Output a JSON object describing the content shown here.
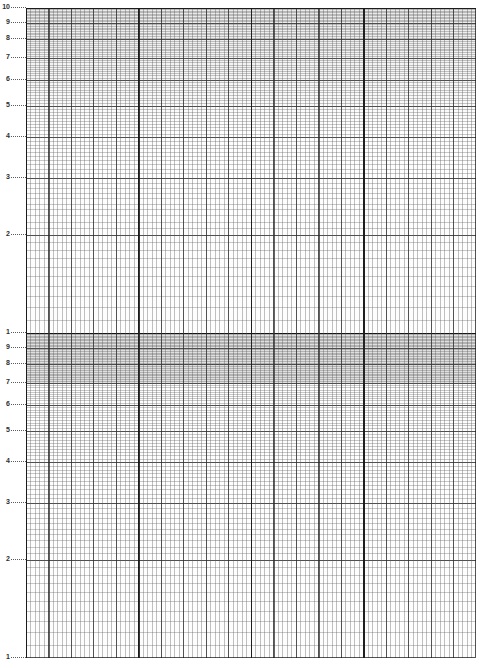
{
  "document": {
    "kind": "semi-logarithmic graph paper",
    "title": "2-Cycle Semi-Log Graph Paper",
    "background_color": "#ffffff",
    "grid_line_color": "#5a5a5a",
    "major_line_color": "#232323",
    "decade_line_color": "#0a0a0a",
    "shade_color": "#464646"
  },
  "chart_data": {
    "type": "line",
    "title": "",
    "subtitle": "",
    "xlabel": "",
    "ylabel": "",
    "grid": "on",
    "legend": "none",
    "yscale": "log",
    "xscale": "linear",
    "cycles": 2,
    "ylim": [
      1,
      100
    ],
    "xlim": [
      0,
      100
    ],
    "series": [],
    "x": [],
    "values": [],
    "annotations": [],
    "y_tick_labels": [
      "10",
      "9",
      "8",
      "7",
      "6",
      "5",
      "4",
      "3",
      "2",
      "1",
      "9",
      "8",
      "7",
      "6",
      "5",
      "4",
      "3",
      "2",
      "1"
    ],
    "y_tick_values": [
      100,
      90,
      80,
      70,
      60,
      50,
      40,
      30,
      20,
      10,
      9,
      8,
      7,
      6,
      5,
      4,
      3,
      2,
      1
    ],
    "x_minor_spacing_px": 4.5,
    "x_major_every": 5,
    "x_heavy_every": 25,
    "x_tick_labels": []
  },
  "axis": {
    "ticks": [
      {
        "label": "10",
        "value": 100
      },
      {
        "label": "9",
        "value": 90
      },
      {
        "label": "8",
        "value": 80
      },
      {
        "label": "7",
        "value": 70
      },
      {
        "label": "6",
        "value": 60
      },
      {
        "label": "5",
        "value": 50
      },
      {
        "label": "4",
        "value": 40
      },
      {
        "label": "3",
        "value": 30
      },
      {
        "label": "2",
        "value": 20
      },
      {
        "label": "1",
        "value": 10
      },
      {
        "label": "9",
        "value": 9
      },
      {
        "label": "8",
        "value": 8
      },
      {
        "label": "7",
        "value": 7
      },
      {
        "label": "6",
        "value": 6
      },
      {
        "label": "5",
        "value": 5
      },
      {
        "label": "4",
        "value": 4
      },
      {
        "label": "3",
        "value": 3
      },
      {
        "label": "2",
        "value": 2
      },
      {
        "label": "1",
        "value": 1
      }
    ]
  },
  "shading": {
    "band_top_value": 10,
    "band_bottom_value": 7
  }
}
